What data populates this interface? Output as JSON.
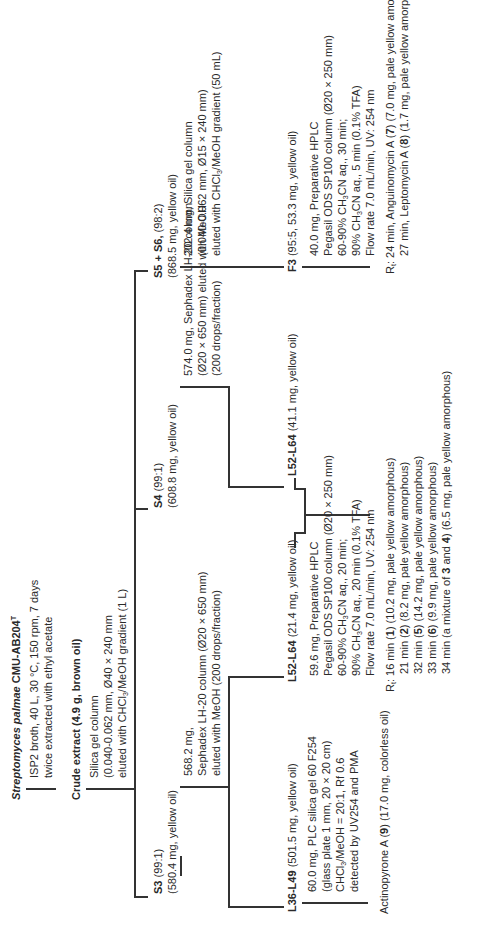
{
  "diagram": {
    "orientation": "rotated-90-ccw",
    "root": {
      "organism": "Streptomyces palmae",
      "strain": "CMU-AB204",
      "strain_sup": "T",
      "culture_lines": [
        "ISP2 broth, 40 L, 30 °C, 150 rpm, 7 days",
        "twice extracted with ethyl acetate"
      ]
    },
    "crude": {
      "label": "Crude extract (4.9 g, brown oil)",
      "method_lines": [
        "Silica gel column",
        "(0.040-0.062 mm, Ø40 × 240 mm",
        "eluted with CHCl3/MeOH gradient (1 L)"
      ]
    },
    "s3": {
      "name": "S3",
      "ratio": "(99:1)",
      "amount": "(580.4 mg, yellow oil)",
      "method_lines": [
        "568.2 mg,",
        "Sephadex LH-20 column (Ø20 × 650 mm)",
        "eluted with MeOH (200 drops/fraction)"
      ]
    },
    "s4": {
      "name": "S4",
      "ratio": "(99:1)",
      "amount": "(608.8 mg, yellow oil)",
      "method_lines": [
        "574.0 mg, Sephadex LH-20 column",
        "(Ø20 × 650 mm) eluted with MeOH",
        "(200 drops/fraction)"
      ]
    },
    "s56": {
      "name": "S5 + S6,",
      "ratio": "(98:2)",
      "amount": "(868.5 mg, yellow oil)",
      "method_lines": [
        "202.4 mg, Silica gel column",
        "(0.040-0.062 mm, Ø15 × 240 mm)",
        "eluted with CHCl3/MeOH gradient (50 mL)"
      ]
    },
    "l3649": {
      "name": "L36-L49",
      "amount": "(501.5 mg, yellow oil)",
      "method_lines": [
        "60.0 mg, PLC silica gel 60 F254",
        "(glass plate 1 mm, 20 × 20 cm)",
        "CHCl3/MeOH = 20:1, Rf 0.6",
        "detected by UV254 and PMA"
      ],
      "product": "Actinopyrone A (9) (17.0 mg, colorless oil)"
    },
    "l5264a": {
      "name": "L52-L64",
      "amount": "(21.4 mg, yellow oil)"
    },
    "l5264b": {
      "name": "L52-L64",
      "amount": "(41.1 mg, yellow oil)",
      "method_lines": [
        "59.6 mg, Preparative HPLC",
        "Pegasil ODS SP100 column (Ø20 × 250 mm)",
        "60-90% CH3CN aq., 20 min;",
        "90% CH3CN aq., 20 min (0.1% TFA)",
        "Flow rate 7.0 mL/min, UV: 254 nm"
      ],
      "products": [
        "16 min (1) (10.2 mg, pale yellow amorphous)",
        "21 min (2) (8.2 mg, pale yellow amorphous)",
        "32 min (5) (14.2 mg, pale yellow amorphous)",
        "33 min (6) (9.9 mg, pale yellow amorphous)",
        "34 min (a mixture of 3 and 4) (6.5 mg, pale yellow amorphous)"
      ]
    },
    "f3": {
      "name": "F3",
      "amount": "(95:5, 53.3 mg, yellow oil)",
      "method_lines": [
        "40.0 mg, Preparative HPLC",
        "Pegasil ODS SP100 column (Ø20 × 250 mm)",
        "60-90% CH3CN aq., 30 min;",
        "90% CH3CN aq., 5 min (0.1% TFA)",
        "Flow rate 7.0 mL/min, UV: 254 nm"
      ],
      "products": [
        "24 min, Anguinomycin A (7) (7.0 mg, pale yellow amorphous)",
        "27 min, Leptomycin A (8) (1.7 mg, pale yellow amorphous)"
      ]
    },
    "rt_label": "R",
    "rt_sub": "t",
    "rt_colon": ":"
  }
}
